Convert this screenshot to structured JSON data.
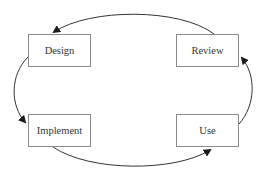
{
  "diagram": {
    "type": "cycle",
    "nodes": [
      {
        "id": "design",
        "label": "Design"
      },
      {
        "id": "review",
        "label": "Review"
      },
      {
        "id": "implement",
        "label": "Implement"
      },
      {
        "id": "use",
        "label": "Use"
      }
    ],
    "edges": [
      {
        "from": "design",
        "to": "implement"
      },
      {
        "from": "implement",
        "to": "use"
      },
      {
        "from": "use",
        "to": "review"
      },
      {
        "from": "review",
        "to": "design"
      }
    ],
    "colors": {
      "line": "#333333",
      "box_border": "#8a8a8a",
      "text": "#333333",
      "background": "#ffffff"
    }
  }
}
